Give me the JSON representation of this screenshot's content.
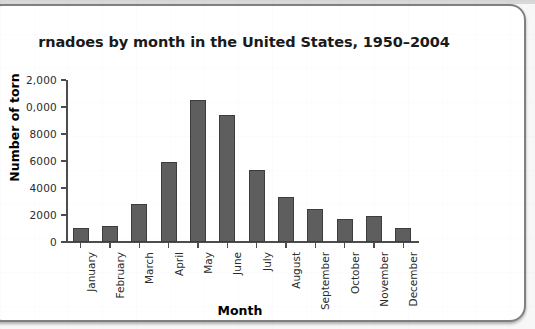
{
  "chart_data": {
    "type": "bar",
    "title": "rnadoes by month in the United States, 1950–2004",
    "xlabel": "Month",
    "ylabel": "Number of torn",
    "categories": [
      "January",
      "February",
      "March",
      "April",
      "May",
      "June",
      "July",
      "August",
      "September",
      "October",
      "November",
      "December"
    ],
    "values": [
      1050,
      1200,
      2850,
      5900,
      10500,
      9400,
      5300,
      3300,
      2450,
      1700,
      1900,
      1050
    ],
    "ylim": [
      0,
      12000
    ],
    "ytick_values": [
      0,
      2000,
      4000,
      6000,
      8000,
      10000,
      12000
    ],
    "ytick_labels": [
      "0",
      "2000",
      "4000",
      "6000",
      "8000",
      "0,000",
      "2,000"
    ],
    "grid": false,
    "legend": "none",
    "bar_color": "#5e5e5e",
    "bar_edge_color": "#3d3d3d",
    "axis_color": "#4d4d4d",
    "background_color": "#ffffff"
  },
  "frame": {
    "border_color": "#808080",
    "page_color": "#f7f7f7"
  }
}
